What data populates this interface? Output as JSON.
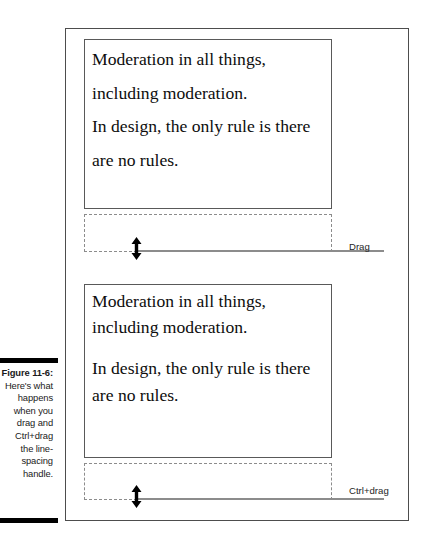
{
  "figure": {
    "caption_label": "Figure 11-6:",
    "caption_body": "Here's what happens when you drag and Ctrl+drag the line-spacing handle.",
    "frame_border_color": "#4d4d4d",
    "background_color": "#ffffff"
  },
  "blocks": [
    {
      "id": "block-1",
      "paragraphs": [
        "Moderation in all things, including moderation.\nIn design, the only rule is there are no rules."
      ],
      "line_spacing": "loose",
      "handle_label": "Drag",
      "handle_icon": "double-arrow-vertical-icon",
      "box_border_color": "#595959",
      "dashed_border_color": "#8c8c8c"
    },
    {
      "id": "block-2",
      "paragraphs": [
        "Moderation in all things, including moderation.",
        "In design, the only rule is there are no rules."
      ],
      "line_spacing": "tight",
      "handle_label": "Ctrl+drag",
      "handle_icon": "double-arrow-vertical-icon",
      "box_border_color": "#595959",
      "dashed_border_color": "#8c8c8c"
    }
  ]
}
